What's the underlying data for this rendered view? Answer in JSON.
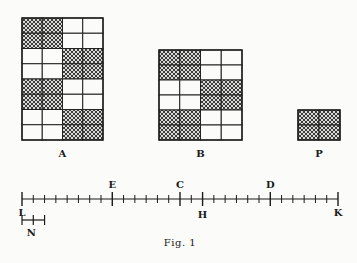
{
  "figure": {
    "caption": "Fig. 1",
    "grids": [
      {
        "label": "A",
        "cols": 4,
        "rows": 8,
        "x": 22,
        "y": 18,
        "width": 81,
        "height": 122,
        "hatched": [
          [
            1,
            1,
            0,
            0
          ],
          [
            1,
            1,
            0,
            0
          ],
          [
            0,
            0,
            1,
            1
          ],
          [
            0,
            0,
            1,
            1
          ],
          [
            1,
            1,
            0,
            0
          ],
          [
            1,
            1,
            0,
            0
          ],
          [
            0,
            0,
            1,
            1
          ],
          [
            0,
            0,
            1,
            1
          ]
        ]
      },
      {
        "label": "B",
        "cols": 4,
        "rows": 6,
        "x": 159,
        "y": 50,
        "width": 83,
        "height": 90,
        "hatched": [
          [
            1,
            1,
            0,
            0
          ],
          [
            1,
            1,
            0,
            0
          ],
          [
            0,
            0,
            1,
            1
          ],
          [
            0,
            0,
            1,
            1
          ],
          [
            1,
            1,
            0,
            0
          ],
          [
            1,
            1,
            0,
            0
          ]
        ]
      },
      {
        "label": "P",
        "cols": 2,
        "rows": 2,
        "x": 298,
        "y": 110,
        "width": 42,
        "height": 30,
        "hatched": [
          [
            1,
            1
          ],
          [
            1,
            1
          ]
        ]
      }
    ],
    "number_line": {
      "start_label": "L",
      "end_label": "K",
      "x_start": 22,
      "x_end": 338,
      "y": 199,
      "divisions": 28,
      "marks": [
        {
          "label": "E",
          "index": 8,
          "label_pos": "above"
        },
        {
          "label": "C",
          "index": 14,
          "label_pos": "above"
        },
        {
          "label": "H",
          "index": 16,
          "label_pos": "below"
        },
        {
          "label": "D",
          "index": 22,
          "label_pos": "above"
        }
      ]
    },
    "unit_segment": {
      "label": "N",
      "units": 2,
      "y": 220
    }
  }
}
